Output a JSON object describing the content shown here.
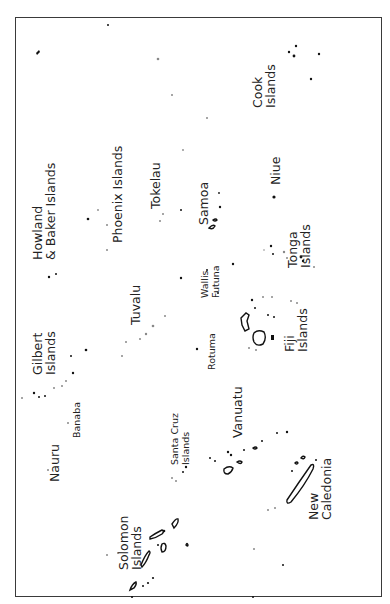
{
  "map": {
    "orientation": "rotated-90-ccw",
    "frame_color": "#3a3a3a",
    "labels": [
      {
        "id": "cook",
        "lines": [
          "Cook",
          "Islands"
        ],
        "x": 262,
        "y": 108,
        "size": "lg"
      },
      {
        "id": "niue",
        "lines": [
          "Niue"
        ],
        "x": 280,
        "y": 185,
        "size": "lg"
      },
      {
        "id": "howland",
        "lines": [
          "Howland",
          "& Baker Islands"
        ],
        "x": 42,
        "y": 260,
        "size": "lg"
      },
      {
        "id": "phoenix",
        "lines": [
          "Phoenix Islands"
        ],
        "x": 122,
        "y": 243,
        "size": "lg"
      },
      {
        "id": "tokelau",
        "lines": [
          "Tokelau"
        ],
        "x": 160,
        "y": 209,
        "size": "lg"
      },
      {
        "id": "samoa",
        "lines": [
          "Samoa"
        ],
        "x": 208,
        "y": 225,
        "size": "lg"
      },
      {
        "id": "tonga",
        "lines": [
          "Tonga",
          "Islands"
        ],
        "x": 297,
        "y": 268,
        "size": "lg"
      },
      {
        "id": "wallis",
        "lines": [
          "Wallis",
          "Futuna"
        ],
        "x": 208,
        "y": 298,
        "size": "sm"
      },
      {
        "id": "tuvalu",
        "lines": [
          "Tuvalu"
        ],
        "x": 140,
        "y": 325,
        "size": "lg"
      },
      {
        "id": "rotuma",
        "lines": [
          "Rotuma"
        ],
        "x": 215,
        "y": 370,
        "size": "sm"
      },
      {
        "id": "fiji",
        "lines": [
          "Fiji",
          "Islands"
        ],
        "x": 294,
        "y": 352,
        "size": "lg"
      },
      {
        "id": "gilbert",
        "lines": [
          "Gilbert",
          "Islands"
        ],
        "x": 42,
        "y": 375,
        "size": "lg"
      },
      {
        "id": "banaba",
        "lines": [
          "Banaba"
        ],
        "x": 80,
        "y": 438,
        "size": "sm"
      },
      {
        "id": "vanuatu",
        "lines": [
          "Vanuatu"
        ],
        "x": 242,
        "y": 438,
        "size": "lg"
      },
      {
        "id": "santacruz",
        "lines": [
          "Santa Cruz",
          "Islands"
        ],
        "x": 178,
        "y": 465,
        "size": "sm"
      },
      {
        "id": "nauru",
        "lines": [
          "Nauru"
        ],
        "x": 59,
        "y": 482,
        "size": "lg"
      },
      {
        "id": "newcal",
        "lines": [
          "New",
          "Caledonia"
        ],
        "x": 318,
        "y": 520,
        "size": "lg"
      },
      {
        "id": "solomon",
        "lines": [
          "Solomon",
          "Islands"
        ],
        "x": 128,
        "y": 570,
        "size": "lg"
      }
    ]
  }
}
